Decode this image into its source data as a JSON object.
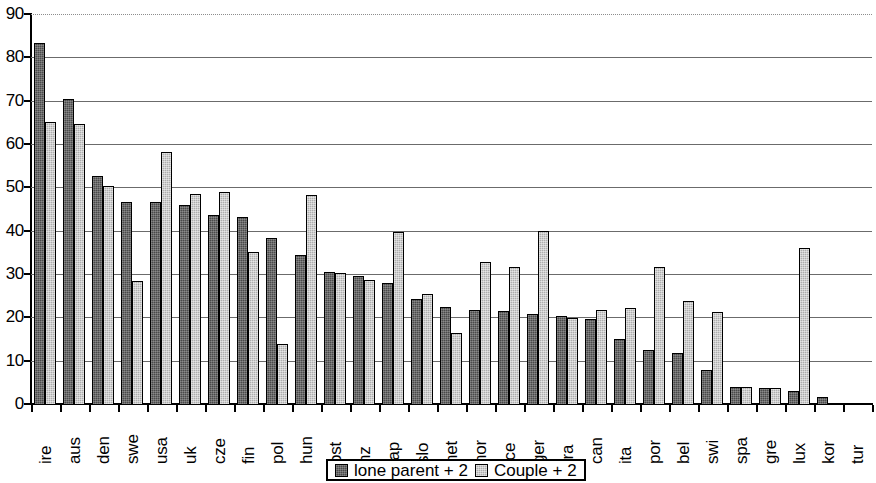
{
  "chart_data": {
    "type": "bar",
    "title": "",
    "xlabel": "",
    "ylabel": "",
    "ylim": [
      0,
      90
    ],
    "ytick_step": 10,
    "yticks": [
      90,
      80,
      70,
      60,
      50,
      40,
      30,
      20,
      10,
      0
    ],
    "grid": true,
    "legend_position": "bottom-center",
    "categories": [
      "ire",
      "aus",
      "den",
      "swe",
      "usa",
      "uk",
      "cze",
      "fin",
      "pol",
      "hun",
      "ost",
      "nz",
      "jap",
      "slo",
      "net",
      "nor",
      "ice",
      "ger",
      "fra",
      "can",
      "ita",
      "por",
      "bel",
      "swi",
      "spa",
      "gre",
      "lux",
      "kor",
      "tur"
    ],
    "series": [
      {
        "name": "lone parent + 2",
        "color": "#4a4a4a",
        "values": [
          83.4,
          70.3,
          52.7,
          46.6,
          46.6,
          46.0,
          43.7,
          43.2,
          38.4,
          34.3,
          30.4,
          29.6,
          28.0,
          24.2,
          22.5,
          21.8,
          21.4,
          20.8,
          20.2,
          19.6,
          14.9,
          12.4,
          11.7,
          7.8,
          4.0,
          3.8,
          3.0,
          1.7,
          0.0
        ]
      },
      {
        "name": "Couple + 2",
        "color": "#adadad",
        "values": [
          65.1,
          64.6,
          50.2,
          28.5,
          58.1,
          48.5,
          48.9,
          35.0,
          13.9,
          48.3,
          30.3,
          28.7,
          39.7,
          25.3,
          16.3,
          32.7,
          31.7,
          40.0,
          19.9,
          21.7,
          22.1,
          31.7,
          23.7,
          21.3,
          4.0,
          3.8,
          36.1,
          0.3,
          0.0
        ]
      }
    ]
  },
  "legend": {
    "items": [
      {
        "label": "lone parent + 2",
        "swatch": "dark"
      },
      {
        "label": "Couple + 2",
        "swatch": "light"
      }
    ]
  }
}
